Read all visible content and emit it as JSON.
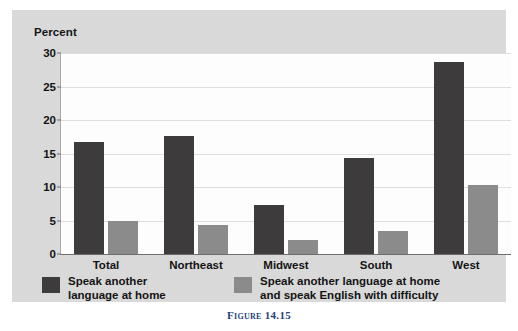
{
  "caption": "Figure 14.15",
  "colors": {
    "series_dark": "#3e3b3c",
    "series_light": "#8b8b8b",
    "panel_bg": "#d9d9d9",
    "plot_bg": "#fdfdfd",
    "gridline": "#dedede",
    "caption_text": "#2a3f7a"
  },
  "chart_data": {
    "type": "bar",
    "title": "",
    "subtitle": "",
    "xlabel": "",
    "ylabel": "Percent",
    "ylim": [
      0,
      30
    ],
    "yticks": [
      0,
      5,
      10,
      15,
      20,
      25,
      30
    ],
    "ytick_labels": [
      "0",
      "5",
      "10",
      "15",
      "20",
      "25",
      "30"
    ],
    "grid": true,
    "legend_position": "bottom",
    "categories": [
      "Total",
      "Northeast",
      "Midwest",
      "South",
      "West"
    ],
    "series": [
      {
        "name": "Speak another\nlanguage at home",
        "color": "#3e3b3c",
        "values": [
          16.7,
          17.6,
          7.3,
          14.4,
          28.7
        ]
      },
      {
        "name": "Speak another language at home\nand speak English with difficulty",
        "color": "#8b8b8b",
        "values": [
          5.0,
          4.3,
          2.1,
          3.5,
          10.3
        ]
      }
    ]
  }
}
